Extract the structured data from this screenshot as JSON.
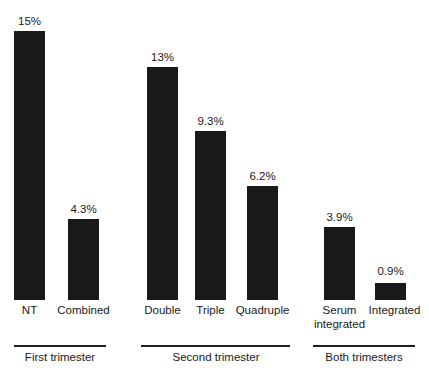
{
  "chart_data": {
    "type": "bar",
    "title": "",
    "subtitle": "",
    "xlabel": "",
    "ylabel": "",
    "ylim": [
      0,
      15
    ],
    "grid": false,
    "legend": false,
    "orientation": "vertical",
    "bar_color": "#191919",
    "categories": [
      "NT",
      "Combined",
      "Double",
      "Triple",
      "Quadruple",
      "Serum integrated",
      "Integrated"
    ],
    "values": [
      15,
      4.3,
      13,
      9.3,
      6.2,
      3.9,
      0.9
    ],
    "value_labels": [
      "15%",
      "13%",
      "9.3%",
      "6.2%",
      "4.3%",
      "3.9%",
      "0.9%"
    ],
    "bars": [
      {
        "category": "NT",
        "category_line1": "NT",
        "category_line2": "",
        "value": 15,
        "label": "15%",
        "group": "First trimester",
        "x": 14,
        "width": 31,
        "top": 31,
        "height": 269,
        "label_x": 8,
        "label_y": 15,
        "label_w": 43,
        "cat_x": -4,
        "cat_y": 304,
        "cat_w": 67
      },
      {
        "category": "Combined",
        "category_line1": "Combined",
        "category_line2": "",
        "value": 4.3,
        "label": "4.3%",
        "group": "First trimester",
        "x": 68,
        "width": 31,
        "top": 219,
        "height": 81,
        "label_x": 61,
        "label_y": 203,
        "label_w": 45,
        "cat_x": 54,
        "cat_y": 304,
        "cat_w": 59
      },
      {
        "category": "Double",
        "category_line1": "Double",
        "category_line2": "",
        "value": 13,
        "label": "13%",
        "group": "Second trimester",
        "x": 147,
        "width": 31,
        "top": 67,
        "height": 233,
        "label_x": 141,
        "label_y": 51,
        "label_w": 43,
        "cat_x": 135,
        "cat_y": 304,
        "cat_w": 55
      },
      {
        "category": "Triple",
        "category_line1": "Triple",
        "category_line2": "",
        "value": 9.3,
        "label": "9.3%",
        "group": "Second trimester",
        "x": 195,
        "width": 31,
        "top": 131,
        "height": 169,
        "label_x": 188,
        "label_y": 115,
        "label_w": 45,
        "cat_x": 184,
        "cat_y": 304,
        "cat_w": 53
      },
      {
        "category": "Quadruple",
        "category_line1": "Quadruple",
        "category_line2": "",
        "value": 6.2,
        "label": "6.2%",
        "group": "Second trimester",
        "x": 247,
        "width": 31,
        "top": 186,
        "height": 114,
        "label_x": 240,
        "label_y": 170,
        "label_w": 45,
        "cat_x": 230,
        "cat_y": 304,
        "cat_w": 65
      },
      {
        "category": "Serum integrated",
        "category_line1": "Serum",
        "category_line2": "integrated",
        "value": 3.9,
        "label": "3.9%",
        "group": "Both trimesters",
        "x": 324,
        "width": 31,
        "top": 227,
        "height": 73,
        "label_x": 317,
        "label_y": 211,
        "label_w": 45,
        "cat_x": 310,
        "cat_y": 304,
        "cat_w": 59
      },
      {
        "category": "Integrated",
        "category_line1": "Integrated",
        "category_line2": "",
        "value": 0.9,
        "label": "0.9%",
        "group": "Both trimesters",
        "x": 375,
        "width": 31,
        "top": 283,
        "height": 17,
        "label_x": 368,
        "label_y": 265,
        "label_w": 45,
        "cat_x": 363,
        "cat_y": 304,
        "cat_w": 63
      }
    ],
    "groups": [
      {
        "label": "First trimester",
        "rule_x": 14,
        "rule_y": 345,
        "rule_w": 92,
        "label_x": 7,
        "label_y": 350,
        "label_w": 106
      },
      {
        "label": "Second trimester",
        "rule_x": 141,
        "rule_y": 345,
        "rule_w": 149,
        "label_x": 155,
        "label_y": 350,
        "label_w": 122
      },
      {
        "label": "Both trimesters",
        "rule_x": 313,
        "rule_y": 345,
        "rule_w": 102,
        "label_x": 312,
        "label_y": 350,
        "label_w": 104
      }
    ],
    "baseline_y": 300
  }
}
